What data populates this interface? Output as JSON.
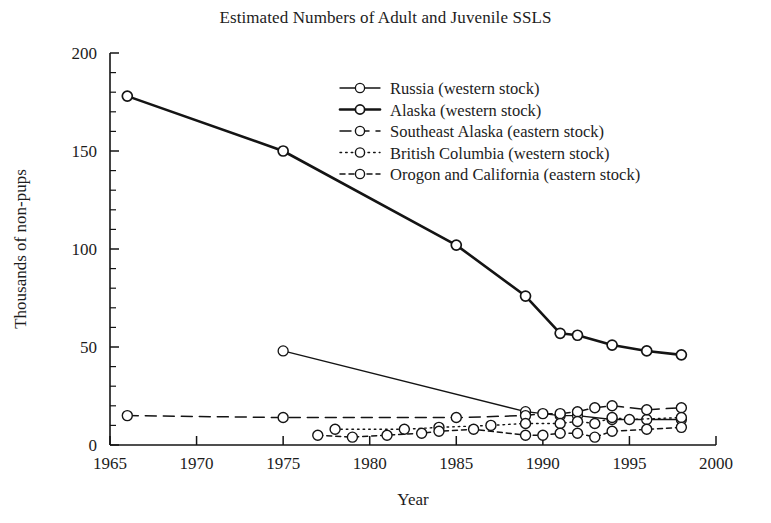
{
  "chart_data": {
    "type": "line",
    "title": "Estimated Numbers of Adult and Juvenile SSLS",
    "xlabel": "Year",
    "ylabel": "Thousands of non-pups",
    "xlim": [
      1965,
      2000
    ],
    "ylim": [
      0,
      200
    ],
    "xticks": [
      1965,
      1970,
      1975,
      1980,
      1985,
      1990,
      1995,
      2000
    ],
    "yticks": [
      0,
      50,
      100,
      150,
      200
    ],
    "x_minor_step": 1,
    "y_minor_step": 10,
    "grid": false,
    "legend_position": "upper right",
    "series": [
      {
        "name": "Russia (western stock)",
        "style": "solid-thin",
        "marker": "open-circle",
        "points": [
          {
            "x": 1975,
            "y": 48
          },
          {
            "x": 1989,
            "y": 17
          },
          {
            "x": 1991,
            "y": 15
          },
          {
            "x": 1992,
            "y": 15
          },
          {
            "x": 1994,
            "y": 13
          },
          {
            "x": 1996,
            "y": 13
          },
          {
            "x": 1998,
            "y": 13
          }
        ]
      },
      {
        "name": "Alaska (western stock)",
        "style": "solid-thick",
        "marker": "open-circle",
        "points": [
          {
            "x": 1966,
            "y": 178
          },
          {
            "x": 1975,
            "y": 150
          },
          {
            "x": 1985,
            "y": 102
          },
          {
            "x": 1989,
            "y": 76
          },
          {
            "x": 1991,
            "y": 57
          },
          {
            "x": 1992,
            "y": 56
          },
          {
            "x": 1994,
            "y": 51
          },
          {
            "x": 1996,
            "y": 48
          },
          {
            "x": 1998,
            "y": 46
          }
        ]
      },
      {
        "name": "Southeast Alaska (eastern stock)",
        "style": "dashed",
        "marker": "open-circle",
        "points": [
          {
            "x": 1966,
            "y": 15
          },
          {
            "x": 1975,
            "y": 14
          },
          {
            "x": 1985,
            "y": 14
          },
          {
            "x": 1989,
            "y": 15
          },
          {
            "x": 1990,
            "y": 16
          },
          {
            "x": 1991,
            "y": 16
          },
          {
            "x": 1992,
            "y": 17
          },
          {
            "x": 1993,
            "y": 19
          },
          {
            "x": 1994,
            "y": 20
          },
          {
            "x": 1996,
            "y": 18
          },
          {
            "x": 1998,
            "y": 19
          }
        ]
      },
      {
        "name": "British Columbia (western stock)",
        "style": "dotted",
        "marker": "open-circle",
        "points": [
          {
            "x": 1978,
            "y": 8
          },
          {
            "x": 1982,
            "y": 8
          },
          {
            "x": 1984,
            "y": 9
          },
          {
            "x": 1987,
            "y": 10
          },
          {
            "x": 1989,
            "y": 11
          },
          {
            "x": 1991,
            "y": 11
          },
          {
            "x": 1992,
            "y": 12
          },
          {
            "x": 1993,
            "y": 11
          },
          {
            "x": 1994,
            "y": 14
          },
          {
            "x": 1995,
            "y": 13
          },
          {
            "x": 1998,
            "y": 14
          }
        ]
      },
      {
        "name": "Orogon and California (eastern stock)",
        "style": "dashed-short",
        "marker": "open-circle",
        "points": [
          {
            "x": 1977,
            "y": 5
          },
          {
            "x": 1979,
            "y": 4
          },
          {
            "x": 1981,
            "y": 5
          },
          {
            "x": 1983,
            "y": 6
          },
          {
            "x": 1984,
            "y": 7
          },
          {
            "x": 1986,
            "y": 8
          },
          {
            "x": 1989,
            "y": 5
          },
          {
            "x": 1990,
            "y": 5
          },
          {
            "x": 1991,
            "y": 6
          },
          {
            "x": 1992,
            "y": 6
          },
          {
            "x": 1993,
            "y": 4
          },
          {
            "x": 1994,
            "y": 7
          },
          {
            "x": 1996,
            "y": 8
          },
          {
            "x": 1998,
            "y": 9
          }
        ]
      }
    ]
  },
  "legend": {
    "items": [
      {
        "label": "Russia (western stock)"
      },
      {
        "label": "Alaska (western stock)"
      },
      {
        "label": "Southeast Alaska (eastern stock)"
      },
      {
        "label": "British Columbia (western stock)"
      },
      {
        "label": "Orogon and California (eastern stock)"
      }
    ]
  },
  "axes": {
    "x_tick_labels": [
      "1965",
      "1970",
      "1975",
      "1980",
      "1985",
      "1990",
      "1995",
      "2000"
    ],
    "y_tick_labels": [
      "0",
      "50",
      "100",
      "150",
      "200"
    ]
  }
}
